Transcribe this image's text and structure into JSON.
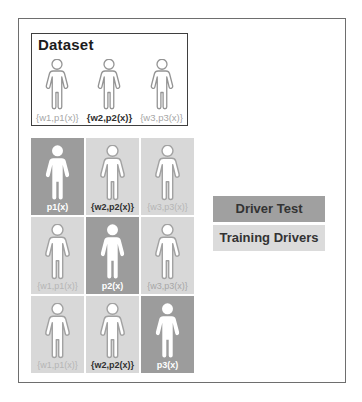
{
  "dataset": {
    "title": "Dataset",
    "people": [
      {
        "label": "{w1,p1(x)}",
        "emphasis": false
      },
      {
        "label": "{w2,p2(x)}",
        "emphasis": true
      },
      {
        "label": "{w3,p3(x)}",
        "emphasis": false
      }
    ]
  },
  "grid": {
    "rows": [
      [
        {
          "label": "p1(x)",
          "role": "test"
        },
        {
          "label": "{w2,p2(x)}",
          "role": "training",
          "emphasis": true
        },
        {
          "label": "{w3,p3(x)}",
          "role": "training",
          "emphasis": false
        }
      ],
      [
        {
          "label": "{w1,p1(x)}",
          "role": "training",
          "emphasis": false
        },
        {
          "label": "p2(x)",
          "role": "test"
        },
        {
          "label": "{w3,p3(x)}",
          "role": "training",
          "emphasis": false
        }
      ],
      [
        {
          "label": "{w1,p1(x)}",
          "role": "training",
          "emphasis": false
        },
        {
          "label": "{w2,p2(x)}",
          "role": "training",
          "emphasis": true
        },
        {
          "label": "p3(x)",
          "role": "test"
        }
      ]
    ]
  },
  "legend": {
    "items": [
      {
        "label": "Driver Test",
        "color": "#a0a0a0"
      },
      {
        "label": "Training Drivers",
        "color": "#dbdbdb"
      }
    ]
  },
  "icons": {
    "person": "person-icon"
  },
  "colors": {
    "test_cell": "#9c9c9c",
    "training_cell": "#d8d8d8",
    "outer_border": "#6e6e6e",
    "dataset_border": "#3f3f3f",
    "background": "#ffffff"
  }
}
